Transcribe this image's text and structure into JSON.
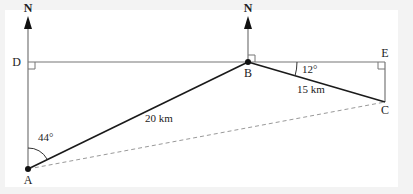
{
  "diagram": {
    "type": "bearing-geometry",
    "points": {
      "A": {
        "label": "A",
        "x": 28,
        "y": 169
      },
      "B": {
        "label": "B",
        "x": 248,
        "y": 62
      },
      "C": {
        "label": "C",
        "x": 385,
        "y": 102
      },
      "D": {
        "label": "D",
        "x": 28,
        "y": 62
      },
      "E": {
        "label": "E",
        "x": 385,
        "y": 62
      }
    },
    "north_labels": [
      "N",
      "N"
    ],
    "angles": {
      "at_A": "44°",
      "at_B": "12°"
    },
    "lengths": {
      "AB": "20 km",
      "BC": "15 km"
    },
    "right_angles": [
      "D",
      "B",
      "E"
    ],
    "dashed_segment": "AC",
    "colors": {
      "main_line": "#1a1a1a",
      "guide_line": "#777777",
      "dashed_line": "#999999",
      "background": "#f3f3f3",
      "card": "#ffffff"
    }
  }
}
